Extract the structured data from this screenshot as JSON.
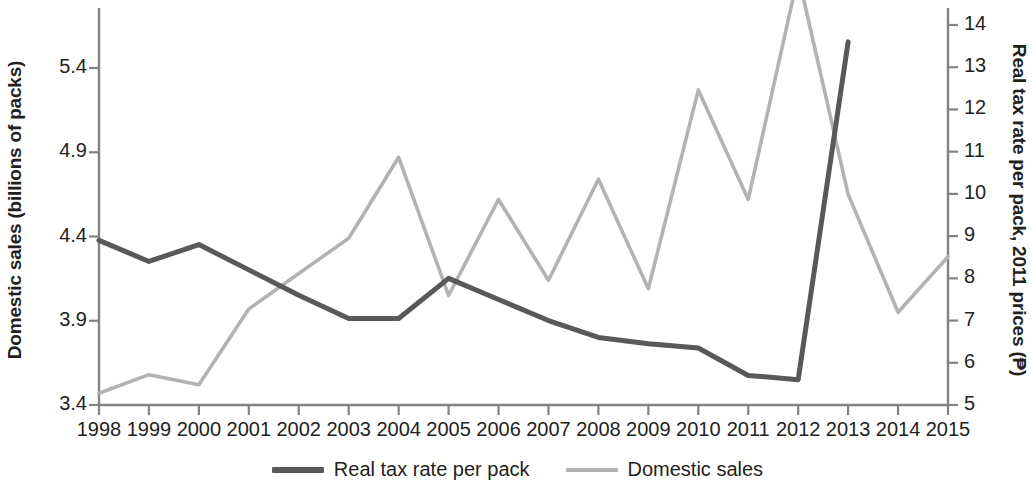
{
  "chart_data": {
    "type": "line",
    "title": "",
    "xlabel": "",
    "ylabel": "Domestic sales (billions of packs)",
    "y2label": "Real tax rate per pack, 2011 prices (₱)",
    "x": [
      1998,
      1999,
      2000,
      2001,
      2002,
      2003,
      2004,
      2005,
      2006,
      2007,
      2008,
      2009,
      2010,
      2011,
      2012,
      2013,
      2014,
      2015
    ],
    "categories": [
      "1998",
      "1999",
      "2000",
      "2001",
      "2002",
      "2003",
      "2004",
      "2005",
      "2006",
      "2007",
      "2008",
      "2009",
      "2010",
      "2011",
      "2012",
      "2013",
      "2014",
      "2015"
    ],
    "ylim": [
      3.4,
      5.4
    ],
    "y2lim": [
      5,
      14
    ],
    "yticks": [
      "3.4",
      "3.9",
      "4.4",
      "4.9",
      "5.4"
    ],
    "ytick_values": [
      3.4,
      3.9,
      4.4,
      4.9,
      5.4
    ],
    "y2ticks": [
      "5",
      "6",
      "7",
      "8",
      "9",
      "10",
      "11",
      "12",
      "13",
      "14"
    ],
    "y2tick_values": [
      5,
      6,
      7,
      8,
      9,
      10,
      11,
      12,
      13,
      14
    ],
    "grid": false,
    "legend_position": "bottom-center",
    "series": [
      {
        "name": "Real tax rate per pack",
        "axis": "right",
        "color": "#58595b",
        "x": [
          1998,
          1999,
          2000,
          2001,
          2002,
          2003,
          2004,
          2005,
          2006,
          2007,
          2008,
          2009,
          2010,
          2011,
          2012,
          2013
        ],
        "values": [
          8.9,
          8.4,
          8.8,
          8.2,
          7.6,
          7.05,
          7.05,
          8.0,
          7.5,
          7.0,
          6.6,
          6.45,
          6.35,
          5.7,
          5.6,
          13.6
        ]
      },
      {
        "name": "Domestic sales",
        "axis": "left",
        "color": "#b3b3b3",
        "x": [
          1998,
          1999,
          2000,
          2001,
          2002,
          2003,
          2004,
          2005,
          2006,
          2007,
          2008,
          2009,
          2010,
          2011,
          2012,
          2013,
          2014,
          2015
        ],
        "values": [
          3.47,
          3.58,
          3.52,
          3.97,
          4.18,
          4.39,
          4.87,
          4.05,
          4.62,
          4.14,
          4.74,
          4.09,
          5.27,
          4.62,
          5.95,
          4.65,
          3.95,
          4.28
        ]
      }
    ]
  },
  "axes": {
    "left_title": "Domestic sales (billions of packs)",
    "right_title": "Real tax rate per pack, 2011 prices (₱)"
  },
  "legend": {
    "items": [
      {
        "label": "Real tax rate per pack",
        "color": "#58595b"
      },
      {
        "label": "Domestic sales",
        "color": "#b3b3b3"
      }
    ]
  },
  "colors": {
    "dark_series": "#58595b",
    "light_series": "#b3b3b3",
    "axis": "#808285",
    "text": "#231f20",
    "background": "#ffffff"
  }
}
